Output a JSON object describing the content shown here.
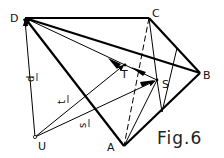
{
  "figure": {
    "caption": "Fig.6",
    "points": {
      "D": "D",
      "C": "C",
      "B": "B",
      "A": "A",
      "U": "U",
      "T": "T",
      "S": "S"
    },
    "vectors": {
      "d": "d",
      "t": "t",
      "s": "s"
    }
  }
}
